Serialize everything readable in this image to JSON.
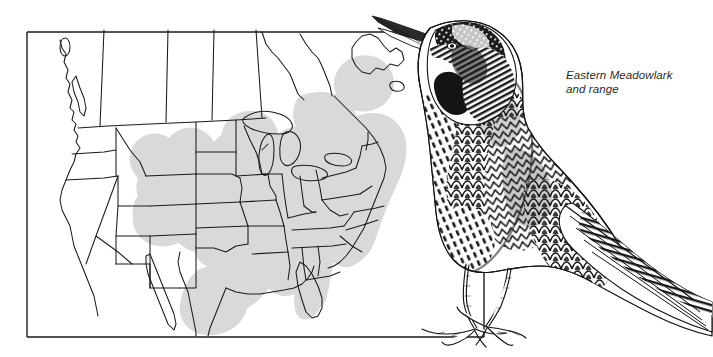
{
  "figure": {
    "kind": "range-map-with-bird-illustration",
    "caption_line1": "Eastern Meadowlark",
    "caption_line2": "and range",
    "caption_full": "Eastern Meadowlark\nand range",
    "map_frame": {
      "label": "map-border-rectangle",
      "x": 27,
      "y": 32,
      "width": 457,
      "height": 305,
      "stroke_color": "#1a1a1a"
    },
    "colors": {
      "background": "#ffffff",
      "ink": "#1a1a1a",
      "state_outline": "#1a1a1a",
      "range_shading": "#d9d9d9",
      "caption_text": "#2b2b2b"
    },
    "range": {
      "label": "eastern-meadowlark-breeding-range",
      "shading_description": "light gray fill over eastern and south-central North America",
      "fill": "#d9d9d9"
    },
    "illustration": {
      "label": "eastern-meadowlark-engraving",
      "style": "pen-and-ink stipple engraving",
      "description": "perched meadowlark facing left with long pointed bill, streaked crown, dark breast crescent, scalloped wing feathers, barred tail, and legs overlapping the map frame"
    }
  }
}
